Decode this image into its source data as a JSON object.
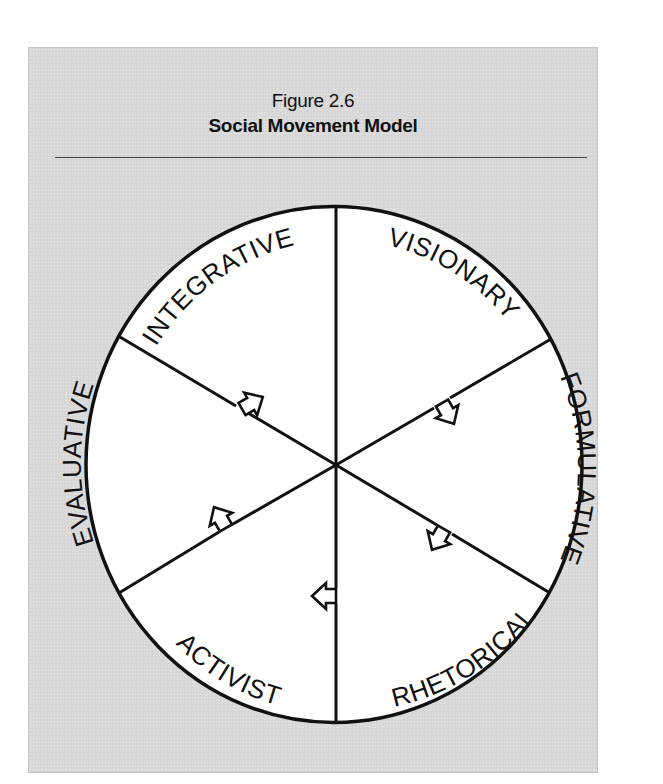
{
  "figure": {
    "number": "Figure 2.6",
    "title": "Social Movement Model"
  },
  "diagram": {
    "type": "cycle-wheel",
    "center": "hub",
    "flow_direction": "clockwise",
    "segments": [
      {
        "label": "VISIONARY",
        "position": "top-right"
      },
      {
        "label": "FORMULATIVE",
        "position": "right"
      },
      {
        "label": "RHETORICAL",
        "position": "bottom-right"
      },
      {
        "label": "ACTIVIST",
        "position": "bottom-left"
      },
      {
        "label": "EVALUATIVE",
        "position": "left"
      },
      {
        "label": "INTEGRATIVE",
        "position": "top-left"
      }
    ],
    "transitions": [
      {
        "from": "VISIONARY",
        "to": "FORMULATIVE"
      },
      {
        "from": "FORMULATIVE",
        "to": "RHETORICAL"
      },
      {
        "from": "RHETORICAL",
        "to": "ACTIVIST"
      },
      {
        "from": "ACTIVIST",
        "to": "EVALUATIVE"
      },
      {
        "from": "EVALUATIVE",
        "to": "INTEGRATIVE"
      }
    ],
    "colors": {
      "panel_background": "#d9d9d9",
      "wheel_fill": "#ffffff",
      "stroke": "#111111"
    }
  }
}
